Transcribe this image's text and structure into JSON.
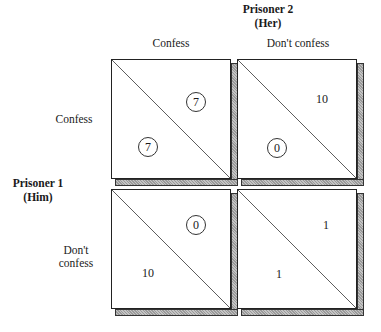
{
  "column_player": {
    "name": "Prisoner 2",
    "sub": "(Her)"
  },
  "row_player": {
    "name": "Prisoner 1",
    "sub": "(Him)"
  },
  "columns": [
    "Confess",
    "Don't confess"
  ],
  "rows": [
    {
      "label_line1": "Confess",
      "label_line2": ""
    },
    {
      "label_line1": "Don't",
      "label_line2": "confess"
    }
  ],
  "cells": [
    {
      "row": "Confess",
      "col": "Confess",
      "her": "7",
      "him": "7",
      "her_circled": true,
      "him_circled": true
    },
    {
      "row": "Confess",
      "col": "Don't confess",
      "her": "10",
      "him": "0",
      "her_circled": false,
      "him_circled": true
    },
    {
      "row": "Don't confess",
      "col": "Confess",
      "her": "0",
      "him": "10",
      "her_circled": true,
      "him_circled": false
    },
    {
      "row": "Don't confess",
      "col": "Don't confess",
      "her": "1",
      "him": "1",
      "her_circled": false,
      "him_circled": false
    }
  ]
}
